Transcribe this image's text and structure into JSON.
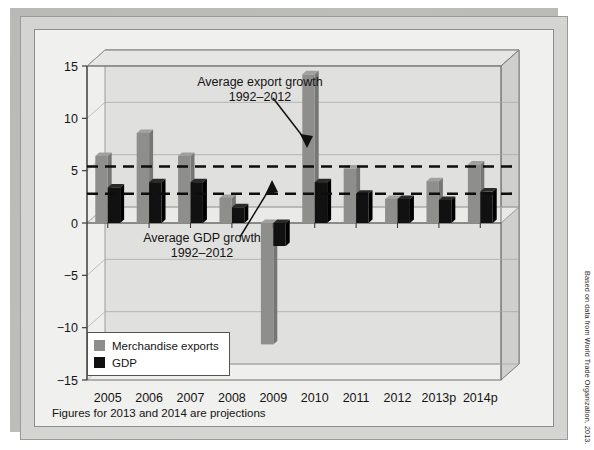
{
  "figure": {
    "footnote": "Figures for 2013 and 2014 are projections",
    "source_credit": "Based on data from World Trade Organization, 2013."
  },
  "legend": {
    "position": "inside-lower-left",
    "items": [
      {
        "label": "Merchandise exports",
        "color": "#8e8e8c",
        "key": "exports"
      },
      {
        "label": "GDP",
        "color": "#111111",
        "key": "gdp"
      }
    ]
  },
  "annotations": [
    {
      "id": "export-avg",
      "line1": "Average export growth",
      "line2": "1992–2012",
      "value": 5.4
    },
    {
      "id": "gdp-avg",
      "line1": "Average GDP growth",
      "line2": "1992–2012",
      "value": 2.8
    }
  ],
  "axis": {
    "y_ticks": [
      "15",
      "10",
      "5",
      "0",
      "−5",
      "−10",
      "−15"
    ],
    "x_ticks": [
      "2005",
      "2006",
      "2007",
      "2008",
      "2009",
      "2010",
      "2011",
      "2012",
      "2013p",
      "2014p"
    ]
  },
  "chart_data": {
    "type": "bar",
    "title": "",
    "subtitle": "",
    "xlabel": "",
    "ylabel": "",
    "ylim": [
      -15,
      15
    ],
    "ytick_step": 5,
    "grid": true,
    "legend_position": "inside lower left",
    "categories": [
      "2005",
      "2006",
      "2007",
      "2008",
      "2009",
      "2010",
      "2011",
      "2012",
      "2013p",
      "2014p"
    ],
    "series": [
      {
        "name": "Merchandise exports",
        "color": "#8e8e8c",
        "values": [
          6.4,
          8.6,
          6.4,
          2.4,
          -11.6,
          14.2,
          5.2,
          2.3,
          4.0,
          5.6
        ]
      },
      {
        "name": "GDP",
        "color": "#111111",
        "values": [
          3.4,
          3.9,
          3.9,
          1.5,
          -2.2,
          3.9,
          2.8,
          2.3,
          2.2,
          3.0
        ]
      }
    ],
    "reference_lines": [
      {
        "name": "Average export growth 1992–2012",
        "value": 5.4,
        "style": "dashed",
        "color": "#0d0d0d"
      },
      {
        "name": "Average GDP growth 1992–2012",
        "value": 2.8,
        "style": "dashed",
        "color": "#0d0d0d"
      }
    ],
    "notes": "Figures for 2013 and 2014 are projections"
  }
}
